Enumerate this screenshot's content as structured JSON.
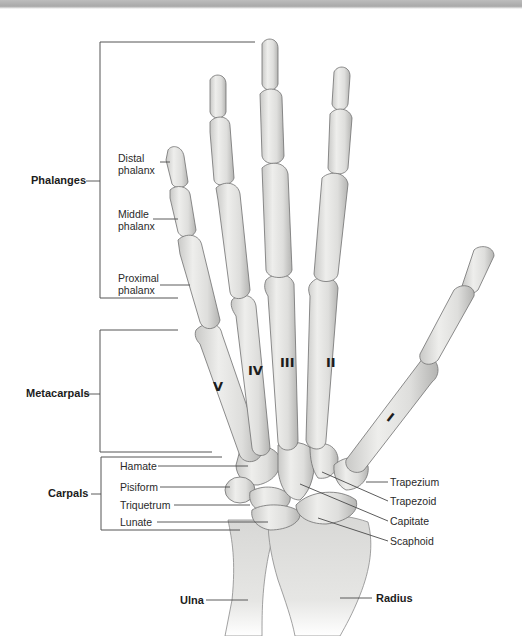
{
  "groups": {
    "phalanges": "Phalanges",
    "metacarpals": "Metacarpals",
    "carpals": "Carpals"
  },
  "phalanx_labels": {
    "distal": [
      "Distal",
      "phalanx"
    ],
    "middle": [
      "Middle",
      "phalanx"
    ],
    "proximal": [
      "Proximal",
      "phalanx"
    ]
  },
  "carpal_labels_left": [
    "Hamate",
    "Pisiform",
    "Triquetrum",
    "Lunate"
  ],
  "carpal_labels_right": [
    "Trapezium",
    "Trapezoid",
    "Capitate",
    "Scaphoid"
  ],
  "forearm_labels": {
    "ulna": "Ulna",
    "radius": "Radius"
  },
  "metacarpal_numerals": [
    "V",
    "IV",
    "III",
    "II",
    "I"
  ],
  "colors": {
    "bone_fill": "#e4e4e2",
    "bone_shade": "#b8b8b6",
    "bone_outline": "#6e6e6e",
    "leader_line": "#4a4a4a",
    "text": "#2a2a2a"
  }
}
